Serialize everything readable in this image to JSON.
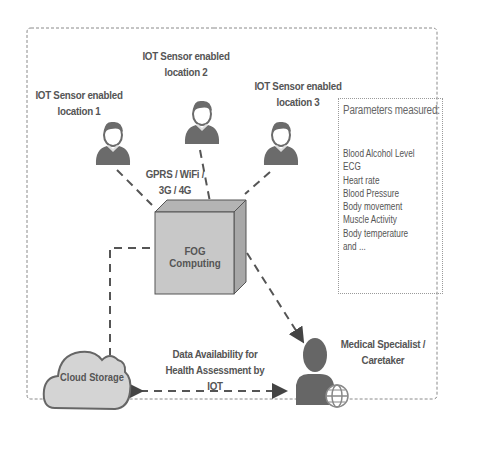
{
  "diagram": {
    "type": "IoT fog computing health monitoring architecture",
    "sensors": [
      {
        "label_line1": "IOT Sensor enabled",
        "label_line2": "location 1",
        "icon": "person-icon"
      },
      {
        "label_line1": "IOT Sensor enabled",
        "label_line2": "location 2",
        "icon": "person-icon"
      },
      {
        "label_line1": "IOT Sensor enabled",
        "label_line2": "location 3",
        "icon": "person-icon"
      }
    ],
    "network": {
      "line1": "GPRS / WiFi /",
      "line2": "3G / 4G"
    },
    "fog": {
      "label": "FOG Computing",
      "icon": "cube-icon"
    },
    "cloud": {
      "label": "Cloud Storage",
      "icon": "cloud-icon"
    },
    "specialist": {
      "line1": "Medical Specialist /",
      "line2": "Caretaker",
      "icon": "person-globe-icon"
    },
    "data_flow": {
      "line1": "Data Availability for",
      "line2": "Health Assessment by IOT"
    },
    "parameters": {
      "title": "Parameters measured:",
      "items": [
        "Blood Alcohol Level",
        "ECG",
        "Heart rate",
        "Blood Pressure",
        "Body movement",
        "Muscle Activity",
        "Body temperature",
        "and ..."
      ]
    },
    "colors": {
      "icon_fill": "#6b6b6b",
      "cube_front": "#c8c8c8",
      "cube_top": "#b4b4b4",
      "cloud_fill": "#d4d4d4",
      "line": "#555555",
      "frame": "#8a8a8a"
    }
  }
}
